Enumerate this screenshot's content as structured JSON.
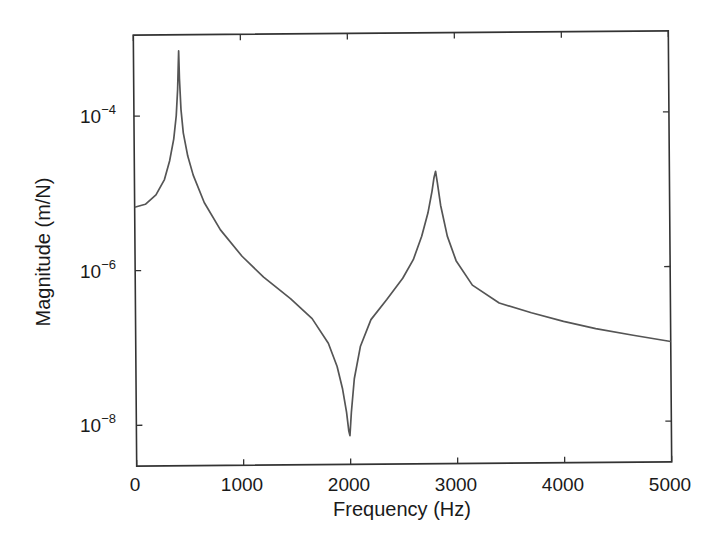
{
  "chart_data": {
    "type": "line",
    "title": "",
    "xlabel": "Frequency (Hz)",
    "ylabel": "Magnitude (m/N)",
    "xscale": "linear",
    "yscale": "log",
    "xlim": [
      0,
      5000
    ],
    "ylim_exponent": [
      -8.55,
      -3.0
    ],
    "grid": false,
    "legend": null,
    "x_ticks": [
      0,
      1000,
      2000,
      3000,
      4000,
      5000
    ],
    "x_tick_labels": [
      "0",
      "1000",
      "2000",
      "3000",
      "4000",
      "5000"
    ],
    "y_ticks_exponent": [
      -4,
      -6,
      -8
    ],
    "y_tick_labels": [
      "10^-4",
      "10^-6",
      "10^-8"
    ],
    "line_color": "#555555",
    "annotations": [
      {
        "label": "resonance 1",
        "x": 420,
        "y": 0.00069
      },
      {
        "label": "anti-resonance",
        "x": 1990,
        "y": 7e-09
      },
      {
        "label": "resonance 2",
        "x": 2810,
        "y": 1.8e-05
      }
    ],
    "series": [
      {
        "name": "FRF magnitude",
        "x": [
          0,
          100,
          200,
          280,
          330,
          370,
          395,
          410,
          418,
          422,
          428,
          440,
          460,
          500,
          550,
          650,
          800,
          1000,
          1200,
          1450,
          1650,
          1800,
          1880,
          1930,
          1965,
          1985,
          1995,
          2010,
          2040,
          2100,
          2200,
          2350,
          2500,
          2600,
          2680,
          2740,
          2780,
          2800,
          2815,
          2830,
          2860,
          2920,
          3000,
          3150,
          3400,
          3700,
          4000,
          4300,
          4650,
          5000
        ],
        "y": [
          6.6e-06,
          7.2e-06,
          9.5e-06,
          1.5e-05,
          2.6e-05,
          5e-05,
          0.0001,
          0.00022,
          0.00045,
          0.00069,
          0.0003,
          0.00012,
          6e-05,
          3e-05,
          1.7e-05,
          7.5e-06,
          3.3e-06,
          1.5e-06,
          8e-07,
          4.2e-07,
          2.3e-07,
          1.1e-07,
          5.5e-08,
          2.8e-08,
          1.4e-08,
          8e-09,
          7e-09,
          1.4e-08,
          3.8e-08,
          1e-07,
          2.2e-07,
          4e-07,
          7.5e-07,
          1.3e-06,
          2.6e-06,
          5.2e-06,
          1e-05,
          1.5e-05,
          1.8e-05,
          1.3e-05,
          6.5e-06,
          2.6e-06,
          1.25e-06,
          6e-07,
          3.5e-07,
          2.6e-07,
          2e-07,
          1.6e-07,
          1.3e-07,
          1.07e-07
        ]
      }
    ]
  }
}
